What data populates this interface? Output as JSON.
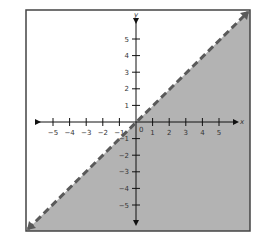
{
  "chart_data": {
    "type": "area",
    "title": "",
    "xlabel": "x",
    "ylabel": "y",
    "xlim": [
      -6,
      6
    ],
    "ylim": [
      -6,
      6
    ],
    "x_ticks": [
      -5,
      -4,
      -3,
      -2,
      -1,
      1,
      2,
      3,
      4,
      5
    ],
    "y_ticks": [
      -5,
      -4,
      -3,
      -2,
      -1,
      1,
      2,
      3,
      4,
      5
    ],
    "origin_label": "0",
    "grid": false,
    "series": [
      {
        "name": "boundary y = x",
        "style": "dashed",
        "x": [
          -6.5,
          6.8
        ],
        "y": [
          -6.5,
          6.8
        ]
      }
    ],
    "shaded_region": "below line (y < x)",
    "colors": {
      "shade": "#b3b3b3",
      "line": "#5a5a5a",
      "axis": "#111111",
      "frame": "#444444"
    }
  }
}
